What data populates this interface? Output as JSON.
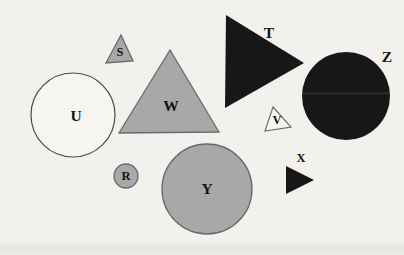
{
  "figure": {
    "colors": {
      "paper": "#f2f1ee",
      "gray": "#a8a8a8",
      "black": "#171717",
      "white": "#f6f5f2",
      "seam": "#2e2e2c",
      "label": "#141414"
    },
    "shapes": {
      "R": {
        "label": "R",
        "kind": "circle",
        "size": "small",
        "color": "gray"
      },
      "S": {
        "label": "S",
        "kind": "triangle",
        "size": "small",
        "color": "gray"
      },
      "T": {
        "label": "T",
        "kind": "triangle",
        "size": "large",
        "color": "black"
      },
      "U": {
        "label": "U",
        "kind": "circle",
        "size": "large",
        "color": "white"
      },
      "V": {
        "label": "V",
        "kind": "triangle",
        "size": "small",
        "color": "white"
      },
      "W": {
        "label": "W",
        "kind": "triangle",
        "size": "large",
        "color": "gray"
      },
      "X": {
        "label": "X",
        "kind": "triangle",
        "size": "small",
        "color": "black"
      },
      "Y": {
        "label": "Y",
        "kind": "circle",
        "size": "large",
        "color": "gray"
      },
      "Z": {
        "label": "Z",
        "kind": "circle",
        "size": "large",
        "color": "black"
      }
    }
  }
}
